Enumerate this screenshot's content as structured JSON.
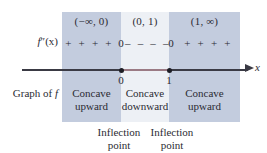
{
  "figure": {
    "axis": {
      "variable_label": "x",
      "tick_labels": [
        "0",
        "1"
      ]
    },
    "row_labels": {
      "second_derivative_prefix": "f",
      "second_derivative_primes": "″(x)",
      "graph_of_f_prefix": "Graph of ",
      "graph_of_f_variable": "f"
    },
    "intervals": [
      {
        "name": "left",
        "heading": "(−∞, 0)",
        "signs": "+ + + +",
        "concavity_line1": "Concave",
        "concavity_line2": "upward",
        "shade_color": "#c3ccde"
      },
      {
        "name": "middle",
        "heading": "(0, 1)",
        "signs": "– – – –",
        "concavity_line1": "Concave",
        "concavity_line2": "downward",
        "shade_color": "#edf0f5"
      },
      {
        "name": "right",
        "heading": "(1, ∞)",
        "signs": "+ + + +",
        "concavity_line1": "Concave",
        "concavity_line2": "upward",
        "shade_color": "#c3ccde"
      }
    ],
    "boundary_zeros": [
      "0",
      "0"
    ],
    "inflection_points": [
      {
        "line1": "Inflection",
        "line2": "point"
      },
      {
        "line1": "Inflection",
        "line2": "point"
      }
    ],
    "colors": {
      "shade_blue": "#c3ccde",
      "shade_light": "#edf0f5",
      "axis": "#3a3a44",
      "text": "#2b2b33",
      "axis_tint": "#9a7a84"
    }
  }
}
